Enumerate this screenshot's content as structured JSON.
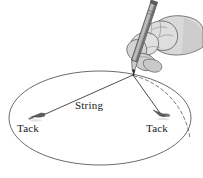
{
  "figure": {
    "background_color": "#ffffff",
    "width": 203,
    "height": 178
  },
  "labels": {
    "tack_left": "Tack",
    "tack_right": "Tack",
    "string": "String"
  },
  "colors": {
    "outline": "#4a4a4a",
    "ellipse_stroke": "#5a5a5a",
    "string_stroke": "#3a3a3a",
    "dashed_arc": "#6b6b6b",
    "hand_fill": "#d9d9d9",
    "hand_shade": "#bdbdbd",
    "pencil_body": "#8a8a8a",
    "pencil_dark": "#5f5f5f",
    "pencil_tip": "#3a3a3a",
    "tack_fill": "#555555",
    "text": "#1a1a1a"
  },
  "geometry": {
    "ellipse": {
      "cx": 100,
      "cy": 118,
      "rx": 91,
      "ry": 47
    },
    "pencil_point": {
      "x": 133,
      "y": 74
    },
    "tack_left": {
      "x": 38,
      "y": 115
    },
    "tack_right": {
      "x": 161,
      "y": 113
    },
    "dashed_arc_note": "arc from pencil point curving right and down to the ellipse edge"
  },
  "elements": {
    "ellipse_name": "ellipse-outline",
    "string_left_name": "string-segment-left",
    "string_right_name": "string-segment-right",
    "dashed_arc_name": "dashed-trace-arc",
    "hand_name": "hand-illustration",
    "pencil_name": "pencil-illustration",
    "tack_left_name": "tack-left-icon",
    "tack_right_name": "tack-right-icon"
  }
}
